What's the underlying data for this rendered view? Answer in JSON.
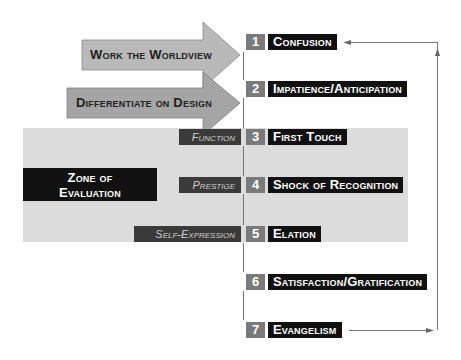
{
  "arrows": [
    {
      "label": "Work the Worldview"
    },
    {
      "label": "Differentiate on Design"
    }
  ],
  "zone": {
    "line1": "Zone of",
    "line2": "Evaluation"
  },
  "side_labels": [
    "Function",
    "Prestige",
    "Self-Expression"
  ],
  "stages": [
    {
      "num": "1",
      "label": "Confusion"
    },
    {
      "num": "2",
      "label": "Impatience/Anticipation"
    },
    {
      "num": "3",
      "label": "First Touch"
    },
    {
      "num": "4",
      "label": "Shock of Recognition"
    },
    {
      "num": "5",
      "label": "Elation"
    },
    {
      "num": "6",
      "label": "Satisfaction/Gratification"
    },
    {
      "num": "7",
      "label": "Evangelism"
    }
  ],
  "colors": {
    "arrow1": "#b9b9b9",
    "arrow2": "#a5a5a5",
    "band": "#dcdcdc",
    "number_box": "#7a7a7a",
    "label_box": "#111111",
    "side_box": "#3a3a3a"
  }
}
